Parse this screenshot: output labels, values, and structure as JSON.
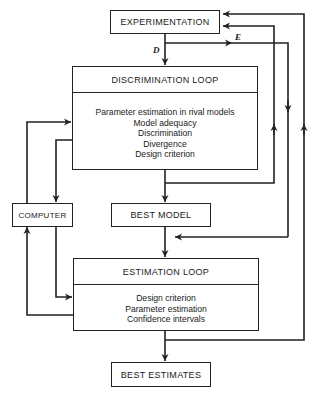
{
  "diagram": {
    "nodes": {
      "experimentation": "EXPERIMENTATION",
      "discrimination_loop": {
        "title": "DISCRIMINATION LOOP",
        "items": [
          "Parameter estimation in rival models",
          "Model adequacy",
          "Discrimination",
          "Divergence",
          "Design criterion"
        ]
      },
      "computer": "COMPUTER",
      "best_model": "BEST MODEL",
      "estimation_loop": {
        "title": "ESTIMATION LOOP",
        "items": [
          "Design criterion",
          "Parameter estimation",
          "Confidence intervals"
        ]
      },
      "best_estimates": "BEST ESTIMATES"
    },
    "edge_labels": {
      "d": "D",
      "e": "E"
    },
    "edges": [
      {
        "from": "EXPERIMENTATION",
        "to": "DISCRIMINATION LOOP",
        "label": "D"
      },
      {
        "from": "EXPERIMENTATION",
        "to": "ESTIMATION LOOP path (right)",
        "label": "E"
      },
      {
        "from": "DISCRIMINATION LOOP",
        "to": "BEST MODEL"
      },
      {
        "from": "DISCRIMINATION LOOP",
        "to": "EXPERIMENTATION"
      },
      {
        "from": "DISCRIMINATION LOOP",
        "to": "COMPUTER"
      },
      {
        "from": "COMPUTER",
        "to": "DISCRIMINATION LOOP"
      },
      {
        "from": "BEST MODEL",
        "to": "ESTIMATION LOOP"
      },
      {
        "from": "ESTIMATION LOOP",
        "to": "COMPUTER"
      },
      {
        "from": "COMPUTER",
        "to": "ESTIMATION LOOP"
      },
      {
        "from": "ESTIMATION LOOP",
        "to": "BEST ESTIMATES"
      },
      {
        "from": "ESTIMATION LOOP",
        "to": "EXPERIMENTATION"
      }
    ],
    "colors": {
      "line": "#222222",
      "background": "#ffffff"
    }
  }
}
